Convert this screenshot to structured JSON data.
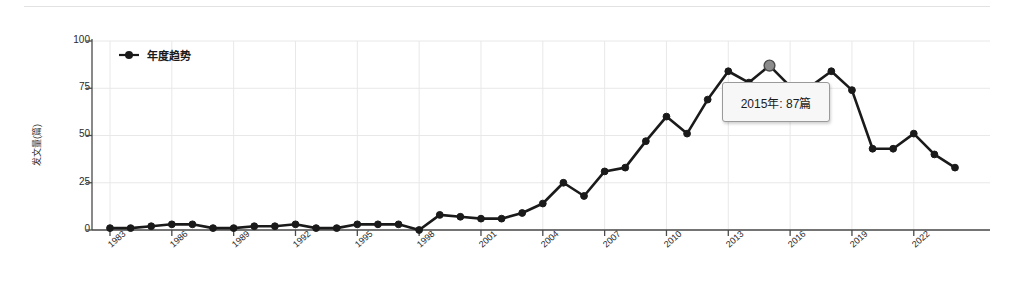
{
  "chart_data": {
    "type": "line",
    "title": "",
    "xlabel": "",
    "ylabel": "发文量(篇)",
    "ylim": [
      0,
      100
    ],
    "yticks": [
      0,
      25,
      50,
      75,
      100
    ],
    "xlim": [
      1983,
      2024
    ],
    "xticks": [
      1983,
      1986,
      1989,
      1992,
      1995,
      1998,
      2001,
      2004,
      2007,
      2010,
      2013,
      2016,
      2019,
      2022
    ],
    "grid": true,
    "legend": {
      "position": "upper-left",
      "entries": [
        "年度趋势"
      ]
    },
    "series": [
      {
        "name": "年度趋势",
        "marker": "circle",
        "color": "#1a1a1a",
        "x": [
          1983,
          1984,
          1985,
          1986,
          1987,
          1988,
          1989,
          1990,
          1991,
          1992,
          1993,
          1994,
          1995,
          1996,
          1997,
          1998,
          1999,
          2000,
          2001,
          2002,
          2003,
          2004,
          2005,
          2006,
          2007,
          2008,
          2009,
          2010,
          2011,
          2012,
          2013,
          2014,
          2015,
          2016,
          2017,
          2018,
          2019,
          2020,
          2021,
          2022,
          2023,
          2024
        ],
        "values": [
          1,
          1,
          2,
          3,
          3,
          1,
          1,
          2,
          2,
          3,
          1,
          1,
          3,
          3,
          3,
          0,
          8,
          7,
          6,
          6,
          9,
          14,
          25,
          18,
          31,
          33,
          47,
          60,
          51,
          69,
          84,
          78,
          87,
          76,
          76,
          84,
          74,
          43,
          43,
          51,
          40,
          33
        ]
      }
    ],
    "highlight": {
      "x": 2015,
      "y": 87,
      "label": "2015年: 87篇"
    },
    "colors": {
      "line": "#1a1a1a",
      "grid": "#e8e8e8",
      "axis": "#4a4a4a",
      "tooltip_bg": "#f7f7f7",
      "tooltip_border": "#9a9a9a",
      "background": "#ffffff"
    }
  },
  "tooltip": {
    "text": "2015年: 87篇"
  },
  "legend": {
    "label": "年度趋势"
  },
  "axes": {
    "y_title": "发文量(篇)",
    "y_ticks": [
      "100",
      "75",
      "50",
      "25",
      "0"
    ],
    "x_ticks": [
      "1983",
      "1986",
      "1989",
      "1992",
      "1995",
      "1998",
      "2001",
      "2004",
      "2007",
      "2010",
      "2013",
      "2016",
      "2019",
      "2022"
    ]
  }
}
